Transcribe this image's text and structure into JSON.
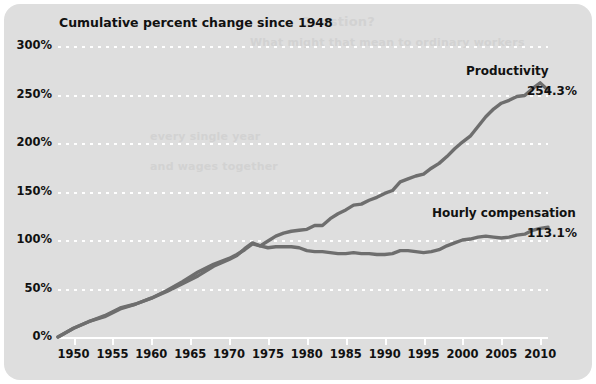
{
  "chart_title": "Cumulative percent change since 1948",
  "ghost_text": {
    "line_1": "Question?",
    "line_2": "What might that mean to ordinary workers",
    "line_3": "every single year",
    "line_4": "and wages together"
  },
  "colors": {
    "card_background": "#dedede",
    "page_background": "#ffffff",
    "line": "#6e6e6e",
    "gridline": "#ffffff",
    "text": "#111111",
    "ghost": "#d2d2d2"
  },
  "axes": {
    "y_ticks": [
      "0%",
      "50%",
      "100%",
      "150%",
      "200%",
      "250%",
      "300%"
    ],
    "y_values": [
      0,
      50,
      100,
      150,
      200,
      250,
      300
    ],
    "x_ticks": [
      "1950",
      "1955",
      "1960",
      "1965",
      "1970",
      "1975",
      "1980",
      "1985",
      "1990",
      "1995",
      "2000",
      "2005",
      "2010"
    ],
    "x_values": [
      1950,
      1955,
      1960,
      1965,
      1970,
      1975,
      1980,
      1985,
      1990,
      1995,
      2000,
      2005,
      2010
    ]
  },
  "annotations": {
    "productivity_name": "Productivity",
    "productivity_value": "254.3%",
    "compensation_name": "Hourly compensation",
    "compensation_value": "113.1%"
  },
  "chart_data": {
    "type": "line",
    "title": "Cumulative percent change since 1948",
    "xlabel": "",
    "ylabel": "Cumulative percent change since 1948",
    "xlim": [
      1948,
      2011
    ],
    "ylim": [
      0,
      300
    ],
    "grid": true,
    "legend": "inline-labels",
    "x": [
      1948,
      1950,
      1952,
      1954,
      1956,
      1958,
      1960,
      1962,
      1964,
      1966,
      1968,
      1970,
      1971,
      1972,
      1973,
      1974,
      1975,
      1976,
      1977,
      1978,
      1979,
      1980,
      1981,
      1982,
      1983,
      1984,
      1985,
      1986,
      1987,
      1988,
      1989,
      1990,
      1991,
      1992,
      1993,
      1994,
      1995,
      1996,
      1997,
      1998,
      1999,
      2000,
      2001,
      2002,
      2003,
      2004,
      2005,
      2006,
      2007,
      2008,
      2009,
      2010,
      2011
    ],
    "series": [
      {
        "name": "Productivity",
        "end_label": "254.3%",
        "values": [
          0,
          9,
          16,
          21,
          29,
          34,
          40,
          48,
          57,
          67,
          75,
          81,
          85,
          90,
          96,
          94,
          99,
          104,
          107,
          109,
          110,
          111,
          115,
          115,
          122,
          127,
          131,
          136,
          137,
          141,
          144,
          148,
          151,
          160,
          163,
          166,
          168,
          174,
          179,
          186,
          194,
          201,
          207,
          217,
          227,
          235,
          241,
          244,
          248,
          249,
          256,
          262,
          254.3
        ]
      },
      {
        "name": "Hourly compensation",
        "end_label": "113.1%",
        "values": [
          0,
          9,
          16,
          22,
          30,
          34,
          40,
          47,
          55,
          63,
          73,
          80,
          84,
          91,
          97,
          94,
          92,
          93,
          93,
          93,
          92,
          89,
          88,
          88,
          87,
          86,
          86,
          87,
          86,
          86,
          85,
          85,
          86,
          89,
          89,
          88,
          87,
          88,
          90,
          94,
          97,
          100,
          101,
          103,
          104,
          103,
          102,
          103,
          105,
          106,
          110,
          112,
          113.1
        ]
      }
    ]
  }
}
